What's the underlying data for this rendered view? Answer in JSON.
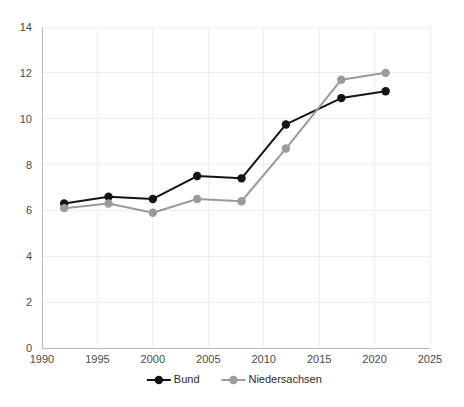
{
  "chart_data": {
    "type": "line",
    "title": "",
    "subtitle": "",
    "xlabel": "",
    "ylabel": "",
    "x": [
      1992,
      1996,
      2000,
      2004,
      2008,
      2012,
      2017,
      2021
    ],
    "series": [
      {
        "name": "Bund",
        "color": "#141414",
        "marker": "circle",
        "values": [
          6.3,
          6.6,
          6.5,
          7.5,
          7.4,
          9.75,
          10.9,
          11.2
        ]
      },
      {
        "name": "Niedersachsen",
        "color": "#9a9a9a",
        "marker": "circle",
        "values": [
          6.1,
          6.3,
          5.9,
          6.5,
          6.4,
          8.7,
          11.7,
          12.0
        ]
      }
    ],
    "xlim": [
      1990,
      2025
    ],
    "ylim": [
      0,
      14
    ],
    "xticks": [
      1990,
      1995,
      2000,
      2005,
      2010,
      2015,
      2020,
      2025
    ],
    "xtick_labels": [
      "1990",
      "1995",
      "2000",
      "2005",
      "2010",
      "2015",
      "2020",
      "2025"
    ],
    "yticks": [
      0,
      2,
      4,
      6,
      8,
      10,
      12,
      14
    ],
    "ytick_labels": [
      "0",
      "2",
      "4",
      "6",
      "8",
      "10",
      "12",
      "14"
    ],
    "grid": {
      "horizontal": true,
      "vertical": true,
      "color": "#eceef0"
    },
    "legend": {
      "position": "bottom-center",
      "entries": [
        {
          "label": "Bund",
          "color": "#141414"
        },
        {
          "label": "Niedersachsen",
          "color": "#9a9a9a"
        }
      ]
    },
    "background_color": "#ffffff",
    "axis_color": "#b8bbbe"
  }
}
